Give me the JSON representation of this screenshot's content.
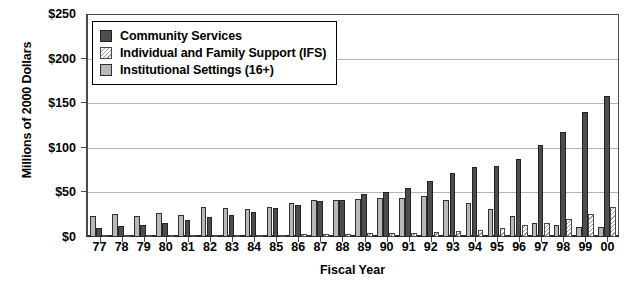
{
  "chart_data": {
    "type": "bar",
    "title": "",
    "xlabel": "Fiscal Year",
    "ylabel": "Millions of 2000 Dollars",
    "ylim": [
      0,
      250
    ],
    "yticks": [
      0,
      50,
      100,
      150,
      200,
      250
    ],
    "ytick_labels": [
      "$0",
      "$50",
      "$100",
      "$150",
      "$200",
      "$250"
    ],
    "grid": true,
    "legend_position": "upper-left-inside",
    "categories": [
      "77",
      "78",
      "79",
      "80",
      "81",
      "82",
      "83",
      "84",
      "85",
      "86",
      "87",
      "88",
      "89",
      "90",
      "91",
      "92",
      "93",
      "94",
      "95",
      "96",
      "97",
      "98",
      "99",
      "00"
    ],
    "series": [
      {
        "name": "Community Services",
        "color": "#4d4d4d",
        "pattern": "solid",
        "values": [
          10,
          12,
          13,
          16,
          19,
          22,
          25,
          28,
          33,
          36,
          40,
          42,
          48,
          50,
          55,
          63,
          72,
          78,
          80,
          88,
          103,
          118,
          140,
          158
        ]
      },
      {
        "name": "Individual and Family Support (IFS)",
        "color": "#9a9a9a",
        "pattern": "diagonal-hatch",
        "values": [
          1,
          1,
          1,
          1,
          1,
          2,
          2,
          2,
          2,
          3,
          3,
          3,
          4,
          4,
          5,
          6,
          7,
          8,
          10,
          14,
          16,
          20,
          26,
          34
        ]
      },
      {
        "name": "Institutional Settings (16+)",
        "color": "#b8b8b8",
        "pattern": "solid-light",
        "values": [
          24,
          26,
          24,
          27,
          25,
          34,
          33,
          31,
          34,
          38,
          41,
          42,
          43,
          44,
          44,
          46,
          42,
          38,
          31,
          23,
          16,
          14,
          11,
          11
        ]
      }
    ]
  },
  "legend": {
    "items": [
      {
        "label": "Community Services",
        "swatch": "swatch-community-services"
      },
      {
        "label": "Individual and Family Support (IFS)",
        "swatch": "swatch-ifs"
      },
      {
        "label": "Institutional Settings (16+)",
        "swatch": "swatch-institutional"
      }
    ]
  }
}
